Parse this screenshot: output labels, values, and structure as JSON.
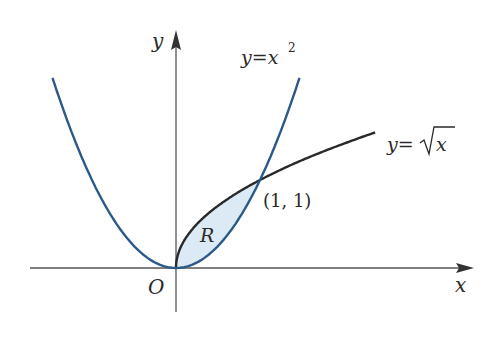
{
  "diagram": {
    "axes": {
      "x_label": "x",
      "y_label": "y",
      "origin_label": "O"
    },
    "curves": [
      {
        "name": "parabola",
        "label": "y=x",
        "exponent": "2",
        "color": "#2b5a8a"
      },
      {
        "name": "sqrt",
        "label_prefix": "y=",
        "label_var": "x",
        "color": "#2a2a2a"
      }
    ],
    "region_label": "R",
    "region_fill": "#dceaf5",
    "intersection_label": "(1, 1)"
  }
}
